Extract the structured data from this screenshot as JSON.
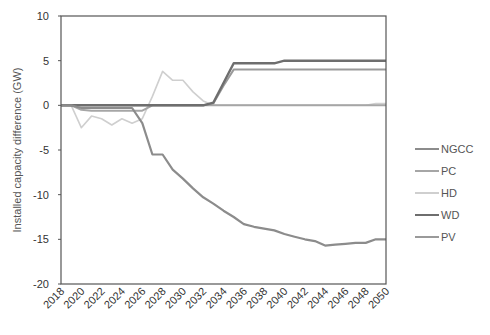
{
  "chart_data": {
    "type": "line",
    "title": "",
    "xlabel": "",
    "ylabel": "Installed capacity difference (GW)",
    "ylim": [
      -20,
      10
    ],
    "yticks": [
      10,
      5,
      0,
      -5,
      -10,
      -15,
      -20
    ],
    "xlim": [
      2018,
      2050
    ],
    "xticks": [
      "2018",
      "2020",
      "2022",
      "2024",
      "2026",
      "2028",
      "2030",
      "2032",
      "2034",
      "2036",
      "2038",
      "2040",
      "2042",
      "2044",
      "2046",
      "2048",
      "2050"
    ],
    "grid": false,
    "legend_position": "right",
    "x": [
      2018,
      2019,
      2020,
      2021,
      2022,
      2023,
      2024,
      2025,
      2026,
      2027,
      2028,
      2029,
      2030,
      2031,
      2032,
      2033,
      2034,
      2035,
      2036,
      2037,
      2038,
      2039,
      2040,
      2041,
      2042,
      2043,
      2044,
      2045,
      2046,
      2047,
      2048,
      2049,
      2050
    ],
    "series": [
      {
        "name": "NGCC",
        "color": "#8c8c8c",
        "width": 2.2,
        "values": [
          0,
          0,
          -0.3,
          -0.3,
          -0.3,
          -0.3,
          -0.3,
          -0.3,
          -2.0,
          -5.5,
          -5.5,
          -7.2,
          -8.2,
          -9.3,
          -10.3,
          -11.0,
          -11.8,
          -12.5,
          -13.3,
          -13.6,
          -13.8,
          -14.0,
          -14.4,
          -14.7,
          -15.0,
          -15.2,
          -15.7,
          -15.6,
          -15.5,
          -15.4,
          -15.4,
          -15.0,
          -15.0
        ]
      },
      {
        "name": "PC",
        "color": "#a6a6a6",
        "width": 2.0,
        "values": [
          0,
          0,
          -0.5,
          -0.6,
          -0.6,
          -0.6,
          -0.6,
          -0.6,
          -0.6,
          0,
          0,
          0,
          0,
          0,
          0,
          0,
          0,
          0,
          0,
          0,
          0,
          0,
          0,
          0,
          0,
          0,
          0,
          0,
          0,
          0,
          0,
          0,
          0
        ]
      },
      {
        "name": "HD",
        "color": "#cfcfcf",
        "width": 1.6,
        "values": [
          0,
          0,
          -2.5,
          -1.2,
          -1.5,
          -2.2,
          -1.5,
          -2.0,
          -1.5,
          1.0,
          3.8,
          2.8,
          2.8,
          1.5,
          0.5,
          0,
          0,
          0,
          0,
          0,
          0,
          0,
          0,
          0,
          0,
          0,
          0,
          0,
          0,
          0,
          0,
          0.2,
          0.2
        ]
      },
      {
        "name": "WD",
        "color": "#6e6e6e",
        "width": 2.4,
        "values": [
          0,
          0,
          0,
          0,
          0,
          0,
          0,
          0,
          0,
          0,
          0,
          0,
          0,
          0,
          0,
          0.3,
          2.5,
          4.7,
          4.7,
          4.7,
          4.7,
          4.7,
          5.0,
          5.0,
          5.0,
          5.0,
          5.0,
          5.0,
          5.0,
          5.0,
          5.0,
          5.0,
          5.0
        ]
      },
      {
        "name": "PV",
        "color": "#9a9a9a",
        "width": 2.0,
        "values": [
          0,
          0,
          0,
          0,
          0,
          0,
          0,
          0,
          0,
          0,
          0,
          0,
          0,
          0,
          0,
          0.2,
          2.2,
          4.0,
          4.0,
          4.0,
          4.0,
          4.0,
          4.0,
          4.0,
          4.0,
          4.0,
          4.0,
          4.0,
          4.0,
          4.0,
          4.0,
          4.0,
          4.0
        ]
      }
    ]
  },
  "legend": {
    "items": [
      {
        "label": "NGCC",
        "color": "#8c8c8c"
      },
      {
        "label": "PC",
        "color": "#a6a6a6"
      },
      {
        "label": "HD",
        "color": "#cfcfcf"
      },
      {
        "label": "WD",
        "color": "#6e6e6e"
      },
      {
        "label": "PV",
        "color": "#9a9a9a"
      }
    ]
  }
}
